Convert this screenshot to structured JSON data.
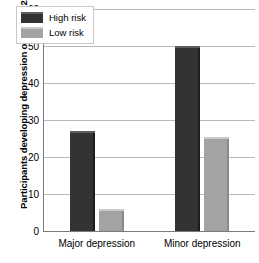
{
  "chart_data": {
    "type": "bar",
    "title": "",
    "xlabel": "",
    "ylabel": "Participants developing depression over next 2.5 years (%)",
    "categories": [
      "Major depression",
      "Minor depression"
    ],
    "series": [
      {
        "name": "High risk",
        "values": [
          27,
          50
        ],
        "color": "#333333"
      },
      {
        "name": "Low risk",
        "values": [
          6,
          25.5
        ],
        "color": "#a3a3a3"
      }
    ],
    "ylim": [
      0,
      60
    ],
    "yticks": [
      0,
      10,
      20,
      30,
      40,
      50,
      60
    ],
    "ytick_labels": [
      "0",
      "10",
      "20",
      "30",
      "40",
      "50",
      "60"
    ],
    "grid": true,
    "legend_position": "top-left-inside"
  }
}
